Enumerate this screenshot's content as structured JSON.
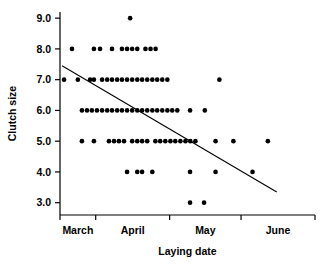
{
  "chart_data": {
    "type": "scatter",
    "title": "",
    "xlabel": "Laying date",
    "ylabel": "Clutch size",
    "grid": false,
    "legend": null,
    "ylim": [
      2.6,
      9.2
    ],
    "yticks": [
      "9.0",
      "8.0",
      "7.0",
      "6.0",
      "5.0",
      "4.0",
      "3.0"
    ],
    "ytick_values": [
      9.0,
      8.0,
      7.0,
      6.0,
      5.0,
      4.0,
      3.0
    ],
    "xlim": [
      0,
      100
    ],
    "xtick_values": [
      0,
      14,
      43,
      71,
      100
    ],
    "xtick_labels": [
      "",
      "",
      "",
      "",
      ""
    ],
    "x_category_labels": [
      "March",
      "April",
      "May",
      "June"
    ],
    "x_category_positions": [
      7,
      28.5,
      57,
      85.5
    ],
    "marker": "filled-circle",
    "marker_color": "#000000",
    "marker_size": 3.6,
    "points": [
      {
        "x": 27.5,
        "y": 9.0
      },
      {
        "x": 4.7,
        "y": 8.0
      },
      {
        "x": 13.3,
        "y": 8.0
      },
      {
        "x": 15.7,
        "y": 8.0
      },
      {
        "x": 20.4,
        "y": 8.0
      },
      {
        "x": 24.3,
        "y": 8.0
      },
      {
        "x": 26.3,
        "y": 8.0
      },
      {
        "x": 28.3,
        "y": 8.0
      },
      {
        "x": 30.3,
        "y": 8.0
      },
      {
        "x": 33.5,
        "y": 8.0
      },
      {
        "x": 35.5,
        "y": 8.0
      },
      {
        "x": 37.5,
        "y": 8.0
      },
      {
        "x": 1.6,
        "y": 7.0
      },
      {
        "x": 7.0,
        "y": 7.0
      },
      {
        "x": 11.8,
        "y": 7.0
      },
      {
        "x": 13.3,
        "y": 7.0
      },
      {
        "x": 16.5,
        "y": 7.0
      },
      {
        "x": 18.5,
        "y": 7.0
      },
      {
        "x": 20.4,
        "y": 7.0
      },
      {
        "x": 22.4,
        "y": 7.0
      },
      {
        "x": 24.3,
        "y": 7.0
      },
      {
        "x": 26.3,
        "y": 7.0
      },
      {
        "x": 28.3,
        "y": 7.0
      },
      {
        "x": 30.3,
        "y": 7.0
      },
      {
        "x": 32.2,
        "y": 7.0
      },
      {
        "x": 34.2,
        "y": 7.0
      },
      {
        "x": 36.2,
        "y": 7.0
      },
      {
        "x": 38.1,
        "y": 7.0
      },
      {
        "x": 40.1,
        "y": 7.0
      },
      {
        "x": 42.1,
        "y": 7.0
      },
      {
        "x": 62.5,
        "y": 7.0
      },
      {
        "x": 8.6,
        "y": 6.0
      },
      {
        "x": 10.6,
        "y": 6.0
      },
      {
        "x": 12.5,
        "y": 6.0
      },
      {
        "x": 14.5,
        "y": 6.0
      },
      {
        "x": 16.5,
        "y": 6.0
      },
      {
        "x": 18.5,
        "y": 6.0
      },
      {
        "x": 20.4,
        "y": 6.0
      },
      {
        "x": 22.4,
        "y": 6.0
      },
      {
        "x": 24.3,
        "y": 6.0
      },
      {
        "x": 26.3,
        "y": 6.0
      },
      {
        "x": 28.3,
        "y": 6.0
      },
      {
        "x": 30.3,
        "y": 6.0
      },
      {
        "x": 32.2,
        "y": 6.0
      },
      {
        "x": 34.2,
        "y": 6.0
      },
      {
        "x": 36.2,
        "y": 6.0
      },
      {
        "x": 38.1,
        "y": 6.0
      },
      {
        "x": 40.1,
        "y": 6.0
      },
      {
        "x": 42.1,
        "y": 6.0
      },
      {
        "x": 44.0,
        "y": 6.0
      },
      {
        "x": 46.0,
        "y": 6.0
      },
      {
        "x": 51.0,
        "y": 6.0
      },
      {
        "x": 56.8,
        "y": 6.0
      },
      {
        "x": 8.6,
        "y": 5.0
      },
      {
        "x": 13.3,
        "y": 5.0
      },
      {
        "x": 19.2,
        "y": 5.0
      },
      {
        "x": 21.2,
        "y": 5.0
      },
      {
        "x": 23.1,
        "y": 5.0
      },
      {
        "x": 25.1,
        "y": 5.0
      },
      {
        "x": 28.3,
        "y": 5.0
      },
      {
        "x": 30.3,
        "y": 5.0
      },
      {
        "x": 32.2,
        "y": 5.0
      },
      {
        "x": 34.2,
        "y": 5.0
      },
      {
        "x": 37.4,
        "y": 5.0
      },
      {
        "x": 39.3,
        "y": 5.0
      },
      {
        "x": 41.3,
        "y": 5.0
      },
      {
        "x": 43.3,
        "y": 5.0
      },
      {
        "x": 45.2,
        "y": 5.0
      },
      {
        "x": 47.2,
        "y": 5.0
      },
      {
        "x": 49.2,
        "y": 5.0
      },
      {
        "x": 51.1,
        "y": 5.0
      },
      {
        "x": 53.1,
        "y": 5.0
      },
      {
        "x": 61.0,
        "y": 5.0
      },
      {
        "x": 68.0,
        "y": 5.0
      },
      {
        "x": 81.5,
        "y": 5.0
      },
      {
        "x": 26.3,
        "y": 4.0
      },
      {
        "x": 30.3,
        "y": 4.0
      },
      {
        "x": 32.2,
        "y": 4.0
      },
      {
        "x": 36.2,
        "y": 4.0
      },
      {
        "x": 51.0,
        "y": 4.0
      },
      {
        "x": 61.0,
        "y": 4.0
      },
      {
        "x": 75.5,
        "y": 4.0
      },
      {
        "x": 51.0,
        "y": 3.0
      },
      {
        "x": 56.5,
        "y": 3.0
      }
    ],
    "trendline": {
      "type": "linear-fit",
      "color": "#000000",
      "x_start": 0.8,
      "y_start": 7.45,
      "x_end": 85.0,
      "y_end": 3.35
    }
  }
}
